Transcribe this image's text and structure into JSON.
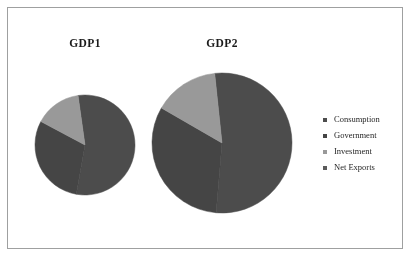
{
  "figure": {
    "background_color": "#ffffff",
    "border_color": "#9fa0a0"
  },
  "legend": {
    "position": "right",
    "items": [
      {
        "label": "Consumption",
        "color": "#4a4a4a"
      },
      {
        "label": "Government",
        "color": "#434343"
      },
      {
        "label": "Investment",
        "color": "#9a9a9a"
      },
      {
        "label": "Net Exports",
        "color": "#5a5a5a"
      }
    ]
  },
  "charts": [
    {
      "title": "GDP1"
    },
    {
      "title": "GDP2"
    }
  ],
  "chart_data": [
    {
      "type": "pie",
      "title": "GDP1",
      "labels": [
        "Consumption",
        "Government",
        "Investment",
        "Net Exports"
      ],
      "values": [
        55,
        30,
        15,
        0
      ],
      "colors": [
        "#4a4a4a",
        "#434343",
        "#9a9a9a",
        "#5a5a5a"
      ],
      "radius_px": 50,
      "start_angle_deg": -8,
      "legend_position": "right",
      "grid": false
    },
    {
      "type": "pie",
      "title": "GDP2",
      "labels": [
        "Consumption",
        "Government",
        "Investment",
        "Net Exports"
      ],
      "values": [
        53,
        32,
        15,
        0
      ],
      "colors": [
        "#4a4a4a",
        "#434343",
        "#9a9a9a",
        "#5a5a5a"
      ],
      "radius_px": 70,
      "start_angle_deg": -6,
      "legend_position": "right",
      "grid": false
    }
  ]
}
